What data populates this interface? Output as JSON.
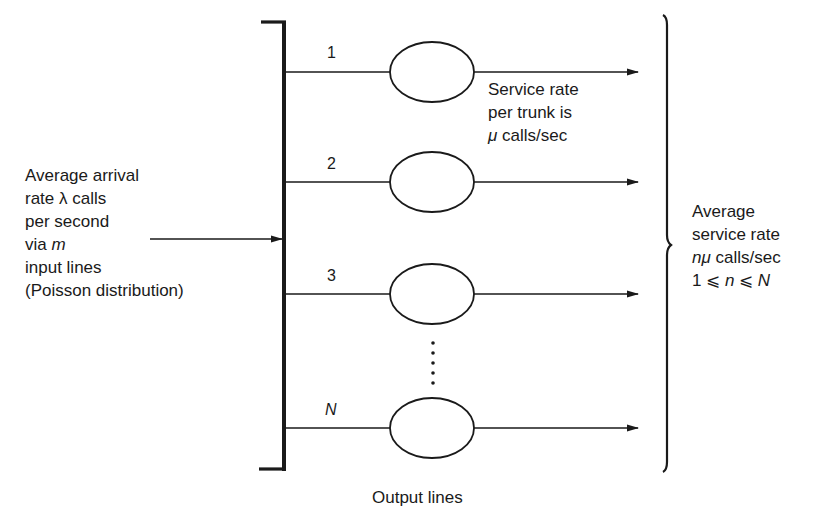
{
  "input": {
    "lines": [
      "Average arrival",
      "rate λ calls",
      "per second",
      "via ",
      "input lines",
      "(Poisson distribution)"
    ],
    "via_var": "m"
  },
  "trunks": [
    {
      "label": "1",
      "y": 72
    },
    {
      "label": "2",
      "y": 182
    },
    {
      "label": "3",
      "y": 294
    },
    {
      "label": "N",
      "y": 428
    }
  ],
  "per_trunk_note": {
    "line1": "Service rate",
    "line2": "per trunk is",
    "line3_var": "μ",
    "line3_rest": " calls/sec"
  },
  "output": {
    "line1": "Average",
    "line2": "service rate",
    "line3_var": "nμ",
    "line3_rest": " calls/sec",
    "line4_a": "1 ⩽ ",
    "line4_n": "n",
    "line4_b": " ⩽ ",
    "line4_N": "N"
  },
  "footer": {
    "label": "Output lines"
  },
  "colors": {
    "ink": "#1a1a1a",
    "background": "#ffffff"
  }
}
